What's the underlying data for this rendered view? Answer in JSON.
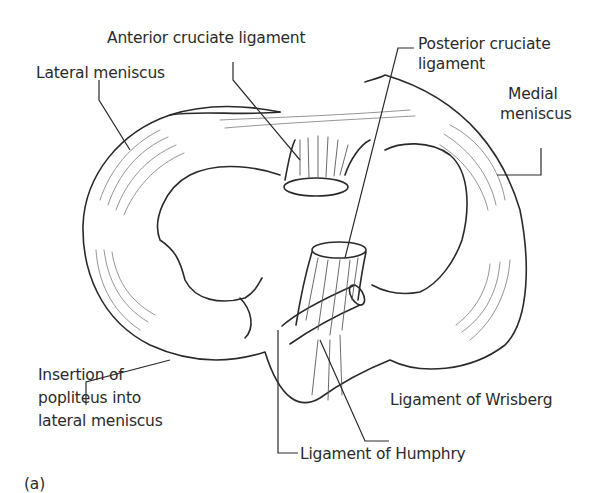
{
  "figure": {
    "panel_label": "(a)"
  },
  "labels": {
    "anterior_cruciate": "Anterior cruciate ligament",
    "posterior_cruciate_line1": "Posterior cruciate",
    "posterior_cruciate_line2": "ligament",
    "lateral_meniscus": "Lateral meniscus",
    "medial_meniscus_line1": "Medial",
    "medial_meniscus_line2": "meniscus",
    "popliteus_line1": "Insertion of",
    "popliteus_line2": "popliteus into",
    "popliteus_line3": "lateral meniscus",
    "wrisberg": "Ligament of Wrisberg",
    "humphry": "Ligament of Humphry"
  },
  "colors": {
    "line": "#2a2a2a",
    "hatch": "#6a6a6a",
    "fill": "#fbfbfb"
  }
}
